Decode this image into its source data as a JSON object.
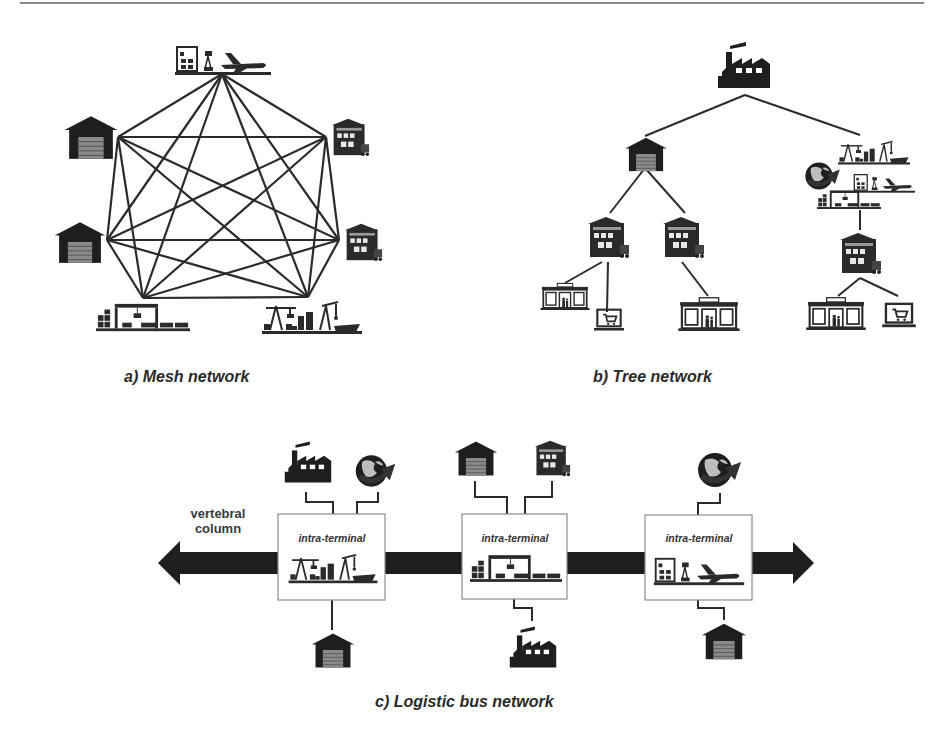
{
  "figure": {
    "title_rule": true,
    "colors": {
      "ink": "#1e1e1e",
      "line": "#2b2b2b",
      "box_border": "#8c8c8c",
      "background": "#ffffff"
    },
    "panels": [
      {
        "id": "a",
        "caption": "a) Mesh network",
        "type": "mesh",
        "nodes": [
          {
            "id": "air",
            "icon": "airport-terminal-icon",
            "x": 222,
            "y": 74
          },
          {
            "id": "dc1",
            "icon": "distribution-center-icon",
            "x": 326,
            "y": 137
          },
          {
            "id": "dc2",
            "icon": "distribution-center-icon",
            "x": 339,
            "y": 240
          },
          {
            "id": "port",
            "icon": "seaport-icon",
            "x": 308,
            "y": 297
          },
          {
            "id": "rail",
            "icon": "rail-terminal-icon",
            "x": 143,
            "y": 298
          },
          {
            "id": "wh2",
            "icon": "warehouse-icon",
            "x": 107,
            "y": 240
          },
          {
            "id": "wh1",
            "icon": "warehouse-icon",
            "x": 118,
            "y": 137
          }
        ],
        "edges": "all-pairs"
      },
      {
        "id": "b",
        "caption": "b) Tree network",
        "type": "tree",
        "root": {
          "icon": "factory-icon",
          "label": "factory"
        },
        "children": [
          {
            "icon": "warehouse-icon",
            "children": [
              {
                "icon": "distribution-center-icon",
                "children": [
                  {
                    "icon": "retail-store-icon"
                  },
                  {
                    "icon": "e-commerce-laptop-icon"
                  }
                ]
              },
              {
                "icon": "distribution-center-icon",
                "children": [
                  {
                    "icon": "retail-store-icon"
                  }
                ]
              }
            ]
          },
          {
            "icon": "intermodal-terminal-group",
            "members": [
              "seaport-icon",
              "globe-icon",
              "airport-terminal-icon",
              "rail-terminal-icon"
            ],
            "children": [
              {
                "icon": "distribution-center-icon",
                "children": [
                  {
                    "icon": "retail-store-icon"
                  },
                  {
                    "icon": "e-commerce-laptop-icon"
                  }
                ]
              }
            ]
          }
        ]
      },
      {
        "id": "c",
        "caption": "c) Logistic bus network",
        "type": "bus",
        "spine_label_line1": "vertebral",
        "spine_label_line2": "column",
        "terminals": [
          {
            "label": "intra-terminal",
            "icon": "seaport-icon",
            "top": [
              "factory-icon",
              "globe-icon"
            ],
            "bottom": [
              "warehouse-icon"
            ]
          },
          {
            "label": "intra-terminal",
            "icon": "rail-terminal-icon",
            "top": [
              "warehouse-icon",
              "distribution-center-icon"
            ],
            "bottom": [
              "factory-icon"
            ]
          },
          {
            "label": "intra-terminal",
            "icon": "airport-terminal-icon",
            "top": [
              "globe-icon"
            ],
            "bottom": [
              "warehouse-icon"
            ]
          }
        ]
      }
    ]
  }
}
